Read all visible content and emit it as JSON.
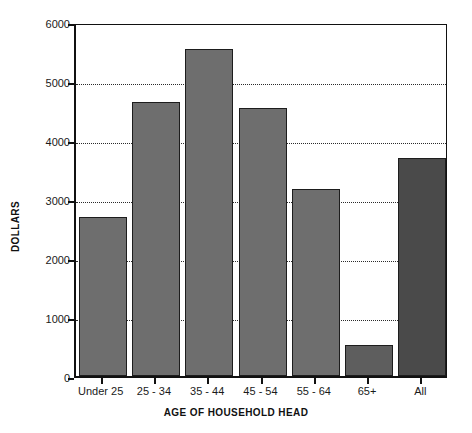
{
  "chart_data": {
    "type": "bar",
    "title": "",
    "xlabel": "AGE OF HOUSEHOLD HEAD",
    "ylabel": "DOLLARS",
    "categories": [
      "Under 25",
      "25 - 34",
      "35 - 44",
      "45 - 54",
      "55 - 64",
      "65+",
      "All"
    ],
    "values": [
      2700,
      4650,
      5550,
      4550,
      3175,
      530,
      3700
    ],
    "ylim": [
      0,
      6000
    ],
    "y_ticks": [
      0,
      1000,
      2000,
      3000,
      4000,
      5000,
      6000
    ],
    "y_tick_labels": [
      "0",
      "1000",
      "2000",
      "3000",
      "4000",
      "5000",
      "6000"
    ],
    "gridlines": {
      "horizontal": true,
      "vertical": false,
      "style": "dotted",
      "at": [
        1000,
        2000,
        3000,
        4000,
        5000
      ]
    },
    "legend": {
      "visible": false,
      "position": "none"
    },
    "series": [
      {
        "name": "Average expenditure",
        "values": [
          2700,
          4650,
          5550,
          4550,
          3175,
          530,
          3700
        ]
      }
    ],
    "bar_colors": [
      "#6e6e6e",
      "#6e6e6e",
      "#6e6e6e",
      "#6e6e6e",
      "#6e6e6e",
      "#5e5e5e",
      "#4a4a4a"
    ]
  },
  "colors": {
    "bar_fill": "#6e6e6e",
    "bar_fill_highlight": "#4a4a4a",
    "bar_border": "#1d1d1d",
    "axis": "#111111",
    "grid": "#2b2b2b",
    "background": "#ffffff",
    "text": "#1a1a1a"
  },
  "axes": {
    "y_title": "DOLLARS",
    "x_title": "AGE OF HOUSEHOLD HEAD"
  }
}
